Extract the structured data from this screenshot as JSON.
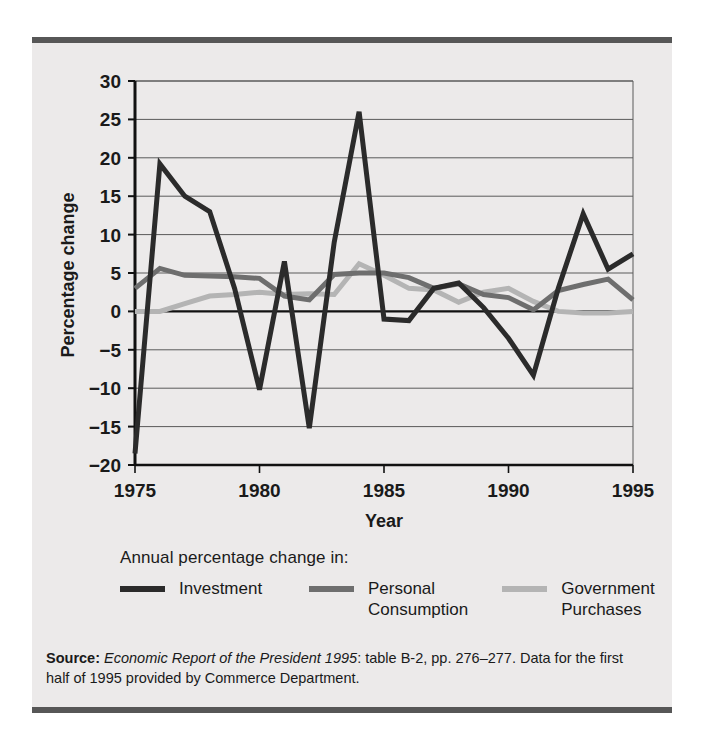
{
  "figure": {
    "background": "#eceaea",
    "rule_color": "#575757"
  },
  "axes": {
    "ylabel": "Percentage change",
    "xlabel": "Year",
    "yticks": [
      "30",
      "25",
      "20",
      "15",
      "10",
      "5",
      "0",
      "−5",
      "−10",
      "−15",
      "−20"
    ],
    "xticks": [
      "1975",
      "1980",
      "1985",
      "1990",
      "1995"
    ]
  },
  "legend": {
    "title": "Annual percentage change in:",
    "entries": [
      {
        "label": "Investment",
        "color": "#2b2b2b"
      },
      {
        "label": "Personal\nConsumption",
        "color": "#6e6e6e"
      },
      {
        "label": "Government\nPurchases",
        "color": "#b4b4b4"
      }
    ]
  },
  "source": {
    "prefix": "Source:",
    "italic": "Economic Report of the President 1995",
    "rest": ": table B-2, pp. 276–277. Data for the first half of 1995 provided by Commerce Department."
  },
  "chart_data": {
    "type": "line",
    "title": "",
    "xlabel": "Year",
    "ylabel": "Percentage change",
    "xlim": [
      1975,
      1995
    ],
    "ylim": [
      -20,
      30
    ],
    "ytick_step": 5,
    "xtick_step": 5,
    "grid": true,
    "legend_position": "below",
    "x": [
      1975,
      1976,
      1977,
      1978,
      1979,
      1980,
      1981,
      1982,
      1983,
      1984,
      1985,
      1986,
      1987,
      1988,
      1989,
      1990,
      1991,
      1992,
      1993,
      1994,
      1995
    ],
    "series": [
      {
        "name": "Investment",
        "color": "#2b2b2b",
        "values": [
          -18.5,
          19.2,
          15.0,
          13.0,
          3.0,
          -10.2,
          6.5,
          -15.2,
          9.0,
          26.0,
          -1.0,
          -1.2,
          3.0,
          3.7,
          0.5,
          -3.5,
          -8.3,
          3.0,
          12.7,
          5.5,
          7.5
        ]
      },
      {
        "name": "Personal Consumption",
        "color": "#6e6e6e",
        "values": [
          3.0,
          5.6,
          4.7,
          4.6,
          4.5,
          4.3,
          2.0,
          1.5,
          4.8,
          5.0,
          5.0,
          4.4,
          3.0,
          3.6,
          2.2,
          1.8,
          0.2,
          2.7,
          3.5,
          4.2,
          1.5
        ]
      },
      {
        "name": "Government Purchases",
        "color": "#b4b4b4",
        "values": [
          0.0,
          0.0,
          1.0,
          2.0,
          2.2,
          2.5,
          2.2,
          2.3,
          2.2,
          6.2,
          4.7,
          3.0,
          2.8,
          1.2,
          2.5,
          3.0,
          1.3,
          0.0,
          -0.2,
          -0.2,
          0.0
        ]
      }
    ]
  }
}
